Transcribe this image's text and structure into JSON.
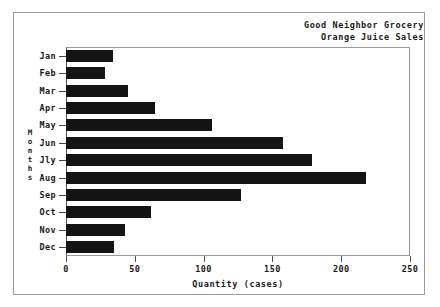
{
  "window": {
    "background_color": "#ffffff",
    "frame_color": "#9a9a9a"
  },
  "titles": {
    "line1": "Good Neighbor Grocery",
    "line2": "Orange Juice Sales"
  },
  "axes": {
    "x_title": "Quantity (cases)",
    "y_title": "Months",
    "y_title_letters": [
      "M",
      "o",
      "n",
      "t",
      "h",
      "s"
    ],
    "x_ticks": [
      "0",
      "50",
      "100",
      "150",
      "200",
      "250"
    ]
  },
  "chart_data": {
    "type": "bar",
    "orientation": "horizontal",
    "title": "Good Neighbor Grocery Orange Juice Sales",
    "subtitle": "Orange Juice Sales",
    "xlabel": "Quantity (cases)",
    "ylabel": "Months",
    "xlim": [
      0,
      250
    ],
    "xticks": [
      0,
      50,
      100,
      150,
      200,
      250
    ],
    "grid": false,
    "legend": false,
    "bar_color": "#141414",
    "categories": [
      "Jan",
      "Feb",
      "Mar",
      "Apr",
      "May",
      "Jun",
      "Jly",
      "Aug",
      "Sep",
      "Oct",
      "Nov",
      "Dec"
    ],
    "values": [
      34,
      28,
      45,
      65,
      106,
      158,
      179,
      218,
      127,
      62,
      43,
      35
    ],
    "bars": [
      {
        "label": "Jan",
        "value": 34
      },
      {
        "label": "Feb",
        "value": 28
      },
      {
        "label": "Mar",
        "value": 45
      },
      {
        "label": "Apr",
        "value": 65
      },
      {
        "label": "May",
        "value": 106
      },
      {
        "label": "Jun",
        "value": 158
      },
      {
        "label": "Jly",
        "value": 179
      },
      {
        "label": "Aug",
        "value": 218
      },
      {
        "label": "Sep",
        "value": 127
      },
      {
        "label": "Oct",
        "value": 62
      },
      {
        "label": "Nov",
        "value": 43
      },
      {
        "label": "Dec",
        "value": 35
      }
    ]
  }
}
